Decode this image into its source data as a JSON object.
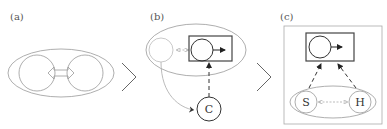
{
  "panels": [
    {
      "id": "a",
      "label": "(a)"
    },
    {
      "id": "b",
      "label": "(b)"
    },
    {
      "id": "c",
      "label": "(c)"
    }
  ],
  "nodes": {
    "b_c": "C",
    "c_s": "S",
    "c_h": "H"
  },
  "separators": [
    ">",
    ">"
  ],
  "colors": {
    "light_stroke": "#999999",
    "dark_stroke": "#333333",
    "box_stroke": "#444444"
  }
}
